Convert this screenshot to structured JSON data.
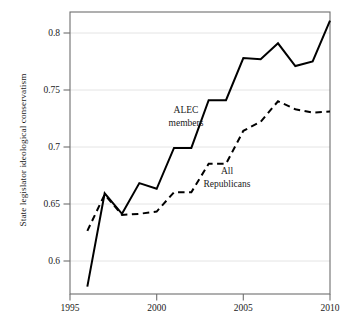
{
  "chart_data": {
    "type": "line",
    "title": "",
    "xlabel": "",
    "ylabel": "State legislator ideological conservatism",
    "xlim": [
      1995,
      2010
    ],
    "ylim": [
      0.5715,
      0.8195
    ],
    "grid": true,
    "grid_orientation": "horizontal",
    "legend_position": "inline-annotations",
    "x_ticks": [
      1995,
      2000,
      2005,
      2010
    ],
    "x_tick_labels": [
      "1995",
      "2000",
      "2005",
      "2010"
    ],
    "y_ticks": [
      0.6,
      0.65,
      0.7,
      0.75,
      0.8
    ],
    "y_tick_labels": [
      "0.6",
      "0.65",
      "0.7",
      "0.75",
      "0.8"
    ],
    "x": [
      1996,
      1997,
      1998,
      1999,
      2000,
      2001,
      2002,
      2003,
      2004,
      2005,
      2006,
      2007,
      2008,
      2009,
      2010
    ],
    "series": [
      {
        "name": "ALEC members",
        "style": "solid",
        "color": "#000000",
        "values": [
          0.578,
          0.66,
          0.642,
          0.669,
          0.664,
          0.7,
          0.7,
          0.742,
          0.742,
          0.779,
          0.778,
          0.792,
          0.772,
          0.776,
          0.812
        ]
      },
      {
        "name": "All Republicans",
        "style": "dashed",
        "color": "#000000",
        "values": [
          0.627,
          0.659,
          0.641,
          0.642,
          0.644,
          0.661,
          0.661,
          0.686,
          0.686,
          0.715,
          0.723,
          0.741,
          0.734,
          0.731,
          0.732
        ]
      }
    ],
    "annotations": [
      {
        "id": "alec-members",
        "lines": [
          "ALEC",
          "members"
        ],
        "x": 2001.1,
        "y": 0.7255
      },
      {
        "id": "all-republicans",
        "lines": [
          "All",
          "Republicans"
        ],
        "x": 2003.1,
        "y": 0.6755
      }
    ]
  },
  "axis": {
    "y_title": "State legislator ideological conservatism",
    "y_tick_0": "0.6",
    "y_tick_1": "0.65",
    "y_tick_2": "0.7",
    "y_tick_3": "0.75",
    "y_tick_4": "0.8",
    "x_tick_0": "1995",
    "x_tick_1": "2000",
    "x_tick_2": "2005",
    "x_tick_3": "2010"
  },
  "annotations": {
    "alec_line1": "ALEC",
    "alec_line2": "members",
    "rep_line1": "All",
    "rep_line2": "Republicans"
  },
  "colors": {
    "line": "#000000",
    "frame": "#6e6e6e",
    "grid": "#e2e2e2",
    "background": "#ffffff"
  }
}
